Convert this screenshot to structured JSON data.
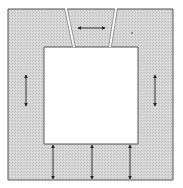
{
  "diagram": {
    "title": "",
    "colors": {
      "background": "#ffffff",
      "frame_fill": "#d4d4d4",
      "frame_stroke": "#555555",
      "arrow": "#222222",
      "gap": "#ffffff"
    },
    "frame": {
      "outer": [
        8,
        9,
        173,
        180
      ],
      "inner": [
        44,
        47,
        138,
        144
      ]
    },
    "keystone": {
      "top_left": 66,
      "top_right": 116,
      "bottom_left": 74,
      "bottom_right": 110,
      "top_y": 9,
      "bottom_y": 47
    },
    "arrows": [
      {
        "id": "keystone-horizontal",
        "x1": 78,
        "y1": 28,
        "x2": 105,
        "y2": 28,
        "heads": "both"
      },
      {
        "id": "left-vertical",
        "x1": 26,
        "y1": 75,
        "x2": 26,
        "y2": 106,
        "heads": "both"
      },
      {
        "id": "right-vertical",
        "x1": 155,
        "y1": 75,
        "x2": 155,
        "y2": 106,
        "heads": "both"
      },
      {
        "id": "bottom-1",
        "x1": 53,
        "y1": 145,
        "x2": 53,
        "y2": 179,
        "heads": "both"
      },
      {
        "id": "bottom-2",
        "x1": 92,
        "y1": 145,
        "x2": 92,
        "y2": 179,
        "heads": "both"
      },
      {
        "id": "bottom-3",
        "x1": 130,
        "y1": 145,
        "x2": 130,
        "y2": 179,
        "heads": "both"
      }
    ],
    "markers": [
      {
        "id": "dot",
        "x": 132,
        "y": 33
      }
    ]
  }
}
